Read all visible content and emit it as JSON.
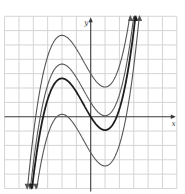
{
  "chart_data": {
    "type": "line",
    "title": "",
    "xlabel": "x",
    "ylabel": "y",
    "xlim": [
      -6,
      6
    ],
    "ylim": [
      -5,
      7
    ],
    "grid": true,
    "grid_step": 1,
    "tick_labels": false,
    "legend": null,
    "base_function": "f(x) = 0.8*(x^3/3 + x^2/2 - 2x)",
    "series": [
      {
        "name": "f(x) + 3",
        "shift": 3,
        "style": "thin",
        "local_max": [
          -2,
          5.67
        ],
        "local_min": [
          1,
          2.07
        ]
      },
      {
        "name": "f(x) + 1",
        "shift": 1,
        "style": "thin",
        "local_max": [
          -2,
          3.67
        ],
        "local_min": [
          1,
          0.07
        ]
      },
      {
        "name": "f(x)",
        "shift": 0,
        "style": "bold",
        "local_max": [
          -2,
          2.67
        ],
        "local_min": [
          1,
          -0.93
        ]
      },
      {
        "name": "f(x) - 2.5",
        "shift": -2.5,
        "style": "thin",
        "local_max": [
          -2,
          0.17
        ],
        "local_min": [
          1,
          -3.43
        ]
      }
    ]
  },
  "labels": {
    "x_axis": "x",
    "y_axis": "y"
  },
  "colors": {
    "grid": "#d4d4d4",
    "axis": "#3a3a3a",
    "curve": "#555555",
    "curve_bold": "#1e1e1e",
    "background": "#ffffff"
  }
}
